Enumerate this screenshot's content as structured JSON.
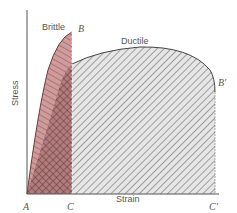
{
  "diagram": {
    "type": "stress-strain curve comparison",
    "axes": {
      "y_label": "Stress",
      "x_label": "Strain"
    },
    "curves": [
      {
        "name": "brittle",
        "label": "Brittle",
        "end_point": "B",
        "strain_end_point": "C",
        "fill_color": "#c9908f",
        "hatch": "diagonal + crosshatch"
      },
      {
        "name": "ductile",
        "label": "Ductile",
        "end_point": "B′",
        "strain_end_point": "C′",
        "fill_color": "#e4e4e4",
        "hatch": "diagonal"
      }
    ],
    "points": {
      "origin": "A",
      "brittle_peak": "B",
      "brittle_strain": "C",
      "ductile_end": "B′",
      "ductile_strain": "C′"
    }
  }
}
